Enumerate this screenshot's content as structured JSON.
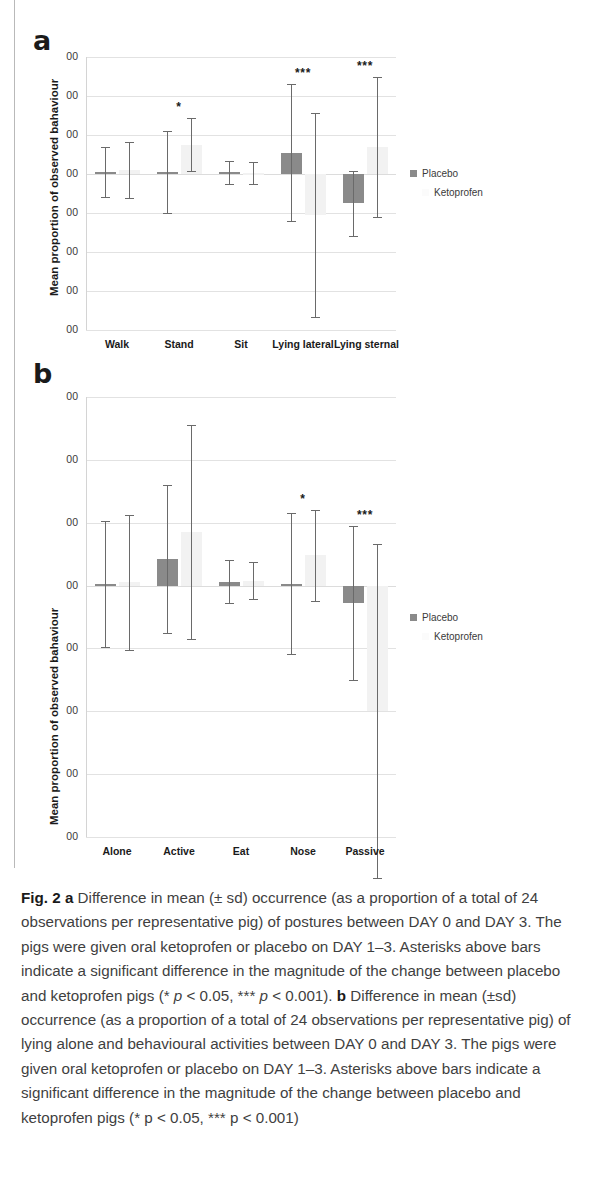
{
  "figure": {
    "label": "Fig. 2",
    "caption_a_letter": "a",
    "caption_a": " Difference in mean (± sd) occurrence (as a proportion of a total of 24 observations per representative pig) of postures between DAY 0 and DAY 3. The pigs were given oral ketoprofen or placebo on DAY 1–3. Asterisks above bars indicate a significant difference in the magnitude of the change between placebo and ketoprofen pigs (* ",
    "caption_a_p1": "p",
    "caption_a_p1_rest": " < 0.05, *** ",
    "caption_a_p2": "p",
    "caption_a_p2_rest": " < 0.001). ",
    "caption_b_letter": "b",
    "caption_b": " Difference in mean (±sd) occurrence (as a proportion of a total of 24 observations per representative pig) of lying alone and behavioural activities between DAY 0 and DAY 3. The pigs were given oral ketoprofen or placebo on DAY 1–3. Asterisks above bars indicate a significant difference in the magnitude of the change between placebo and ketoprofen pigs (* p < 0.05, *** p < 0.001)"
  },
  "legend": {
    "placebo_label": "Placebo",
    "ketoprofen_label": "Ketoprofen"
  },
  "colors": {
    "placebo": "#8a8a8a",
    "ketoprofen": "#f2f2f2",
    "whisker": "#6a6a6a",
    "grid": "#e2e2e2"
  },
  "chart_data": [
    {
      "panel": "a",
      "type": "bar",
      "title": "",
      "xlabel": "",
      "ylabel": "Mean proportion of observed bahaviour",
      "ytick_labels": [
        "00",
        "00",
        "00",
        "00",
        "00",
        "00",
        "00",
        "00"
      ],
      "ytick_values": [
        0.3,
        0.2,
        0.1,
        0.0,
        -0.1,
        -0.2,
        -0.3,
        -0.4
      ],
      "ylim": [
        -0.4,
        0.3
      ],
      "grid": true,
      "zero_line": 0.0,
      "categories": [
        "Walk",
        "Stand",
        "Sit",
        "Lying lateral",
        "Lying sternal"
      ],
      "series": [
        {
          "name": "Placebo",
          "values": [
            0.005,
            0.005,
            0.004,
            0.055,
            -0.075
          ],
          "errors": [
            0.063,
            0.105,
            0.03,
            0.175,
            0.083
          ]
        },
        {
          "name": "Ketoprofen",
          "values": [
            0.01,
            0.075,
            0.003,
            -0.105,
            0.07
          ],
          "errors": [
            0.072,
            0.068,
            0.028,
            0.262,
            0.18
          ]
        }
      ],
      "significance": [
        {
          "category": "Stand",
          "marker": "*"
        },
        {
          "category": "Lying lateral",
          "marker": "***"
        },
        {
          "category": "Lying sternal",
          "marker": "***"
        }
      ]
    },
    {
      "panel": "b",
      "type": "bar",
      "title": "",
      "xlabel": "",
      "ylabel": "Mean proportion of observed bahaviour",
      "ytick_labels": [
        "00",
        "00",
        "00",
        "00",
        "00",
        "00",
        "00",
        "00"
      ],
      "ytick_values": [
        0.3,
        0.2,
        0.1,
        0.0,
        -0.1,
        -0.2,
        -0.3,
        -0.4
      ],
      "ylim": [
        -0.4,
        0.3
      ],
      "grid": true,
      "zero_line": 0.0,
      "categories": [
        "Alone",
        "Active",
        "Eat",
        "Nose",
        "Passive"
      ],
      "series": [
        {
          "name": "Placebo",
          "values": [
            0.003,
            0.042,
            0.006,
            0.003,
            -0.028
          ],
          "errors": [
            0.1,
            0.118,
            0.034,
            0.112,
            0.122
          ]
        },
        {
          "name": "Ketoprofen",
          "values": [
            0.005,
            0.085,
            0.008,
            0.048,
            -0.2
          ],
          "errors": [
            0.108,
            0.17,
            0.03,
            0.073,
            0.266
          ]
        }
      ],
      "significance": [
        {
          "category": "Nose",
          "marker": "*"
        },
        {
          "category": "Passive",
          "marker": "***"
        }
      ]
    }
  ]
}
